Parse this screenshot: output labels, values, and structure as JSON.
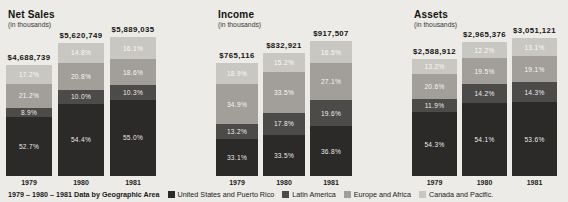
{
  "colors": {
    "background": "#ecebe7",
    "us_pr": "#2b2a28",
    "latin_america": "#4d4b49",
    "europe_africa": "#a29f9b",
    "canada_pacific": "#c9c7c2"
  },
  "legend": {
    "intro": "1979 – 1980 – 1981 Data by Geographic Area",
    "items": [
      {
        "label": "United States and Puerto Rico",
        "color_key": "us_pr"
      },
      {
        "label": "Latin America",
        "color_key": "latin_america"
      },
      {
        "label": "Europe and Africa",
        "color_key": "europe_africa"
      },
      {
        "label": "Canada and Pacific.",
        "color_key": "canada_pacific"
      }
    ]
  },
  "chart_data": [
    {
      "type": "bar",
      "variant": "stacked-percent",
      "title": "Net Sales",
      "subtitle": "(in thousands)",
      "categories": [
        "1979",
        "1980",
        "1981"
      ],
      "totals_label": [
        "$4,688,739",
        "$5,620,749",
        "$5,889,035"
      ],
      "totals": [
        4688739,
        5620749,
        5889035
      ],
      "series": [
        {
          "name": "United States and Puerto Rico",
          "color_key": "us_pr",
          "values": [
            52.7,
            54.4,
            55.0
          ]
        },
        {
          "name": "Latin America",
          "color_key": "latin_america",
          "values": [
            8.9,
            10.0,
            10.3
          ]
        },
        {
          "name": "Europe and Africa",
          "color_key": "europe_africa",
          "values": [
            21.2,
            20.8,
            18.6
          ]
        },
        {
          "name": "Canada and Pacific",
          "color_key": "canada_pacific",
          "values": [
            17.2,
            14.8,
            16.1
          ]
        }
      ]
    },
    {
      "type": "bar",
      "variant": "stacked-percent",
      "title": "Income",
      "subtitle": "(in thousands)",
      "categories": [
        "1979",
        "1980",
        "1981"
      ],
      "totals_label": [
        "$765,116",
        "$832,921",
        "$917,507"
      ],
      "totals": [
        765116,
        832921,
        917507
      ],
      "series": [
        {
          "name": "United States and Puerto Rico",
          "color_key": "us_pr",
          "values": [
            33.1,
            33.5,
            36.8
          ]
        },
        {
          "name": "Latin America",
          "color_key": "latin_america",
          "values": [
            13.2,
            17.8,
            19.6
          ]
        },
        {
          "name": "Europe and Africa",
          "color_key": "europe_africa",
          "values": [
            34.9,
            33.5,
            27.1
          ]
        },
        {
          "name": "Canada and Pacific",
          "color_key": "canada_pacific",
          "values": [
            18.9,
            15.2,
            16.5
          ]
        }
      ]
    },
    {
      "type": "bar",
      "variant": "stacked-percent",
      "title": "Assets",
      "subtitle": "(in thousands)",
      "categories": [
        "1979",
        "1980",
        "1981"
      ],
      "totals_label": [
        "$2,588,912",
        "$2,965,376",
        "$3,051,121"
      ],
      "totals": [
        2588912,
        2965376,
        3051121
      ],
      "series": [
        {
          "name": "United States and Puerto Rico",
          "color_key": "us_pr",
          "values": [
            54.3,
            54.1,
            53.6
          ]
        },
        {
          "name": "Latin America",
          "color_key": "latin_america",
          "values": [
            11.9,
            14.2,
            14.3
          ]
        },
        {
          "name": "Europe and Africa",
          "color_key": "europe_africa",
          "values": [
            20.6,
            19.5,
            19.1
          ]
        },
        {
          "name": "Canada and Pacific",
          "color_key": "canada_pacific",
          "values": [
            13.2,
            12.2,
            13.1
          ]
        }
      ]
    }
  ]
}
